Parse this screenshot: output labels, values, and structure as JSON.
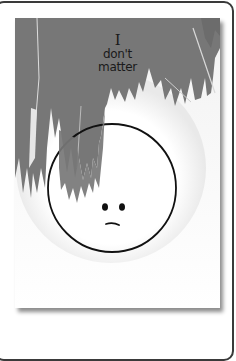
{
  "illustration": {
    "caption_lines": [
      "I",
      "don't",
      "matter"
    ],
    "subject": "sad-face-circle",
    "colors": {
      "paint": "#7a7a7a",
      "paint_dark": "#6e6e6e",
      "card": "#ffffff",
      "frame": "#3a3a3a",
      "ink": "#111111"
    }
  }
}
